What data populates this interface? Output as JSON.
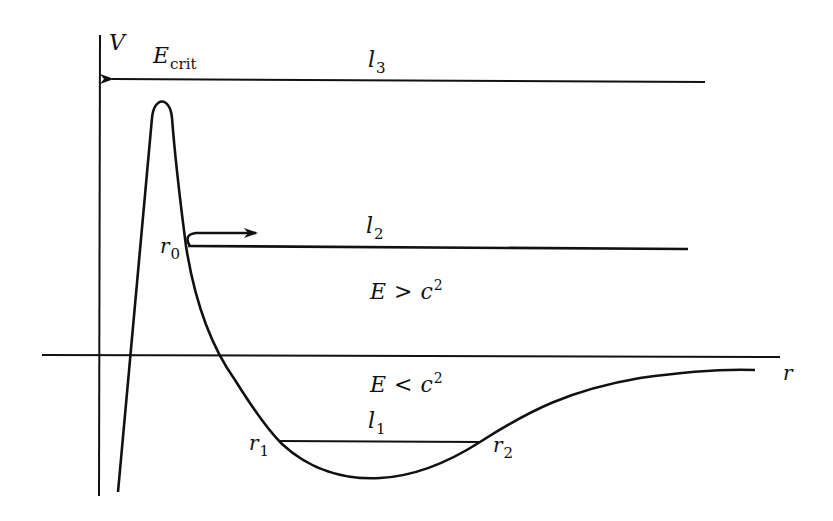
{
  "diagram": {
    "axes": {
      "y_label": "V",
      "x_label": "r"
    },
    "levels": {
      "l3": {
        "name": "l",
        "sub": "3",
        "annotation_name": "E",
        "annotation_sub": "crit"
      },
      "l2": {
        "name": "l",
        "sub": "2"
      },
      "l1": {
        "name": "l",
        "sub": "1"
      }
    },
    "points": {
      "r0": {
        "name": "r",
        "sub": "0"
      },
      "r1": {
        "name": "r",
        "sub": "1"
      },
      "r2": {
        "name": "r",
        "sub": "2"
      }
    },
    "regions": {
      "above": {
        "lhs": "E",
        "rel": ">",
        "rhs": "c",
        "exp": "2"
      },
      "below": {
        "lhs": "E",
        "rel": "<",
        "rhs": "c",
        "exp": "2"
      }
    },
    "colors": {
      "ink": "#111111",
      "background": "#ffffff"
    }
  }
}
